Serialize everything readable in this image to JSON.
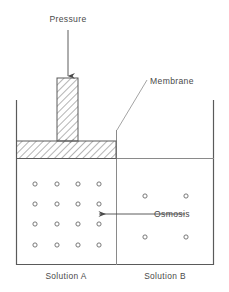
{
  "figure": {
    "type": "osmosis-apparatus-diagram",
    "background_color": "#ffffff",
    "line_color": "#5a5a5a",
    "hatch_color": "#6a6a6a",
    "text_color": "#4a4a4a"
  },
  "labels": {
    "pressure": "Pressure",
    "membrane": "Membrane",
    "osmosis": "Osmosis",
    "solution_a": "Solution A",
    "solution_b": "Solution B"
  },
  "geometry": {
    "container": {
      "left": 16,
      "right": 214,
      "top": 100,
      "bottom": 265
    },
    "membrane": {
      "x": 116,
      "top": 130,
      "bottom": 265
    },
    "piston": {
      "stem": {
        "left": 57,
        "right": 78,
        "top": 78,
        "bottom": 141
      },
      "block": {
        "left": 16,
        "right": 116,
        "top": 141,
        "bottom": 158
      }
    },
    "liquid_level_right": {
      "x1": 116,
      "x2": 214,
      "y": 158
    },
    "pressure_arrow": {
      "x": 68,
      "y1": 30,
      "y2": 77
    },
    "membrane_leader": {
      "x1": 148,
      "x2": 117,
      "y1": 80,
      "y2": 130
    },
    "osmosis_arrow": {
      "x1": 185,
      "x2": 98,
      "y": 214
    }
  },
  "particles": {
    "solution_a": {
      "radius": 2.1,
      "points": [
        {
          "x": 35,
          "y": 184
        },
        {
          "x": 57,
          "y": 184
        },
        {
          "x": 78,
          "y": 184
        },
        {
          "x": 99,
          "y": 184
        },
        {
          "x": 35,
          "y": 204
        },
        {
          "x": 57,
          "y": 204
        },
        {
          "x": 78,
          "y": 204
        },
        {
          "x": 99,
          "y": 204
        },
        {
          "x": 35,
          "y": 224
        },
        {
          "x": 57,
          "y": 224
        },
        {
          "x": 78,
          "y": 224
        },
        {
          "x": 99,
          "y": 224
        },
        {
          "x": 35,
          "y": 245
        },
        {
          "x": 57,
          "y": 245
        },
        {
          "x": 78,
          "y": 245
        },
        {
          "x": 99,
          "y": 245
        }
      ]
    },
    "solution_b": {
      "radius": 2.1,
      "points": [
        {
          "x": 145,
          "y": 196
        },
        {
          "x": 186,
          "y": 196
        },
        {
          "x": 145,
          "y": 237
        },
        {
          "x": 186,
          "y": 237
        }
      ]
    }
  },
  "label_positions": {
    "pressure": {
      "x": 68,
      "y": 22,
      "anchor": "middle"
    },
    "membrane": {
      "x": 150,
      "y": 84,
      "anchor": "start"
    },
    "osmosis": {
      "x": 154,
      "y": 217,
      "anchor": "start"
    },
    "solution_a": {
      "x": 66,
      "y": 279,
      "anchor": "middle"
    },
    "solution_b": {
      "x": 165,
      "y": 279,
      "anchor": "middle"
    }
  }
}
